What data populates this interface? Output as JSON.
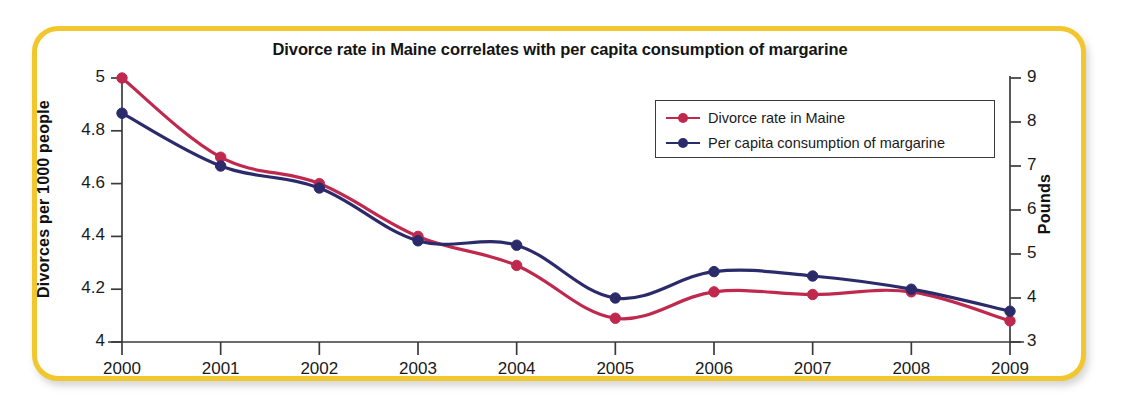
{
  "frame": {
    "border_color": "#f2c72e",
    "background": "#ffffff"
  },
  "chart_data": {
    "type": "line",
    "title": "Divorce rate in Maine correlates with per capita consumption of margarine",
    "xlabel": "",
    "ylabel": "Divorces per 1000 people",
    "y2label": "Pounds",
    "categories": [
      "2000",
      "2001",
      "2002",
      "2003",
      "2004",
      "2005",
      "2006",
      "2007",
      "2008",
      "2009"
    ],
    "x": [
      2000,
      2001,
      2002,
      2003,
      2004,
      2005,
      2006,
      2007,
      2008,
      2009
    ],
    "grid": false,
    "legend_position": "upper-right",
    "ylim": [
      4,
      5
    ],
    "yticks": [
      "4",
      "4.2",
      "4.4",
      "4.6",
      "4.8",
      "5"
    ],
    "ytick_values": [
      4,
      4.2,
      4.4,
      4.6,
      4.8,
      5
    ],
    "y2lim": [
      3,
      9
    ],
    "y2ticks": [
      "3",
      "4",
      "5",
      "6",
      "7",
      "8",
      "9"
    ],
    "y2tick_values": [
      3,
      4,
      5,
      6,
      7,
      8,
      9
    ],
    "series": [
      {
        "name": "Divorce rate in Maine",
        "axis": "left",
        "color": "#c0294e",
        "marker": "circle",
        "values": [
          5.0,
          4.7,
          4.6,
          4.4,
          4.29,
          4.09,
          4.19,
          4.18,
          4.19,
          4.08
        ]
      },
      {
        "name": "Per capita consumption of margarine",
        "axis": "right",
        "color": "#2b2b6b",
        "marker": "circle",
        "units": "pounds",
        "values": [
          8.2,
          7.0,
          6.5,
          5.3,
          5.2,
          4.0,
          4.6,
          4.5,
          4.2,
          3.7
        ],
        "values_in_left_axis_scale": [
          4.867,
          4.667,
          4.583,
          4.383,
          4.367,
          4.167,
          4.267,
          4.25,
          4.2,
          4.117
        ]
      }
    ]
  },
  "legend": {
    "items": [
      {
        "label": "Divorce rate in Maine",
        "color": "#c0294e"
      },
      {
        "label": "Per capita consumption of margarine",
        "color": "#2b2b6b"
      }
    ]
  }
}
